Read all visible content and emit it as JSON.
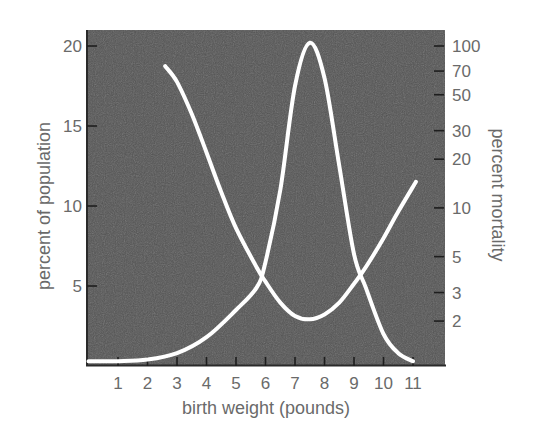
{
  "chart_data": {
    "type": "line",
    "title": "",
    "xlabel": "birth weight (pounds)",
    "ylabel": "percent of population",
    "ylabel_right": "percent mortality",
    "x_ticks": [
      1,
      2,
      3,
      4,
      5,
      6,
      7,
      8,
      9,
      10,
      11
    ],
    "xlim": [
      0,
      12
    ],
    "ylim": [
      0,
      20.6
    ],
    "y_ticks_left": [
      5,
      10,
      15,
      20
    ],
    "y_ticks_right": [
      2,
      3,
      5,
      10,
      20,
      30,
      50,
      70,
      100
    ],
    "y_right_scale": "log",
    "y_right_lim": [
      1,
      120
    ],
    "grid": false,
    "legend": null,
    "background_color": "#555555",
    "line_color": "#ffffff",
    "series": [
      {
        "name": "percent of population",
        "axis": "left",
        "x": [
          0,
          1,
          2,
          3,
          4,
          5,
          5.7,
          6,
          6.5,
          7,
          7.5,
          8,
          8.5,
          9,
          9.4,
          10,
          10.5,
          11
        ],
        "values": [
          0.3,
          0.3,
          0.4,
          0.8,
          1.8,
          3.5,
          4.9,
          6.5,
          11,
          17.5,
          20.2,
          18,
          12.5,
          7,
          4.9,
          2,
          0.8,
          0.3
        ]
      },
      {
        "name": "percent mortality",
        "axis": "right",
        "x": [
          2.6,
          3,
          3.5,
          4,
          4.5,
          5,
          5.7,
          6,
          6.5,
          7,
          7.5,
          8,
          8.5,
          9,
          9.4,
          10,
          10.5,
          11.1
        ],
        "values": [
          75,
          60,
          38,
          22,
          12.5,
          7.5,
          4.3,
          3.5,
          2.6,
          2.15,
          2.05,
          2.2,
          2.6,
          3.4,
          4.3,
          6.5,
          9.5,
          14.5
        ]
      }
    ]
  },
  "labels": {
    "xlabel": "birth weight (pounds)",
    "ylabel_left": "percent of population",
    "ylabel_right": "percent mortality"
  }
}
